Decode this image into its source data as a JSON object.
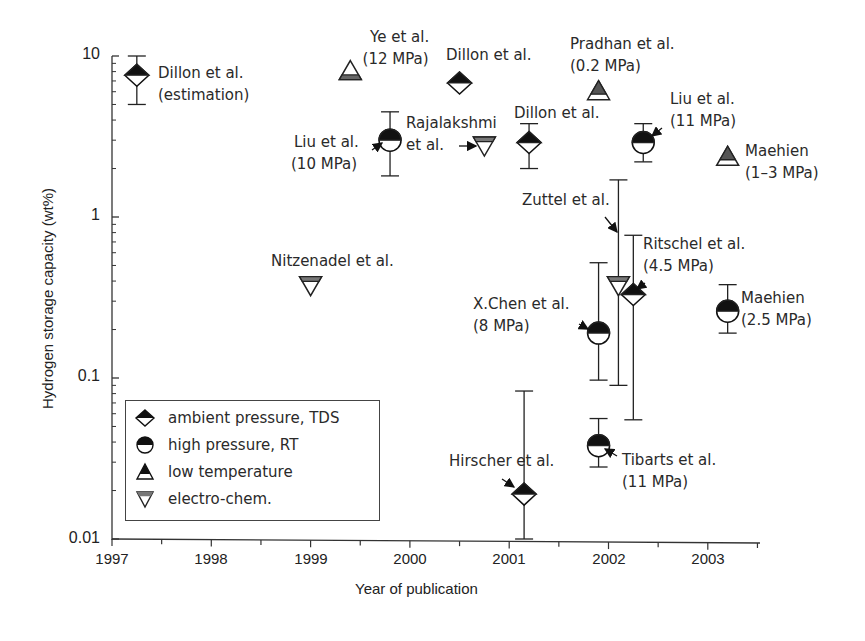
{
  "chart_data": {
    "type": "scatter",
    "title": "",
    "xlabel": "Year of publication",
    "ylabel": "Hydrogen storage capacity (wt%)",
    "yscale": "log",
    "xlim": [
      1997,
      2003.5
    ],
    "ylim": [
      0.01,
      10
    ],
    "x_ticks": [
      "1997",
      "1998",
      "1999",
      "2000",
      "2001",
      "2002",
      "2003"
    ],
    "y_ticks": [
      "0.01",
      "0.1",
      "1",
      "10"
    ],
    "grid": false,
    "legend_position": "lower-left",
    "legend": [
      {
        "key": "ambient",
        "label": "ambient pressure, TDS",
        "marker": "diamond-half-filled"
      },
      {
        "key": "high",
        "label": "high pressure, RT",
        "marker": "circle-half-filled"
      },
      {
        "key": "lowtemp",
        "label": "low temperature",
        "marker": "triangle-up-half-filled"
      },
      {
        "key": "electro",
        "label": "electro-chem.",
        "marker": "triangle-down-half-filled"
      }
    ],
    "points": [
      {
        "label": "Dillon et al. (estimation)",
        "series": "ambient",
        "x": 1997.25,
        "y": 7.6,
        "err_high": 10,
        "err_low": 5
      },
      {
        "label": "Ye et al. (12 MPa)",
        "series": "lowtemp",
        "x": 1999.4,
        "y": 8.0
      },
      {
        "label": "Liu et al. (10 MPa)",
        "series": "high",
        "x": 1999.8,
        "y": 3.0,
        "err_high": 4.5,
        "err_low": 1.8
      },
      {
        "label": "Dillon et al.",
        "series": "ambient",
        "x": 2000.5,
        "y": 6.8
      },
      {
        "label": "Rajalakshmi et al.",
        "series": "electro",
        "x": 2000.75,
        "y": 2.8
      },
      {
        "label": "Dillon et al.",
        "series": "ambient",
        "x": 2001.2,
        "y": 2.9,
        "err_high": 3.8,
        "err_low": 2.0
      },
      {
        "label": "Pradhan et al. (0.2 MPa)",
        "series": "lowtemp",
        "x": 2001.9,
        "y": 6.0
      },
      {
        "label": "Liu et al. (11 MPa)",
        "series": "high",
        "x": 2002.35,
        "y": 2.9,
        "err_high": 3.8,
        "err_low": 2.2
      },
      {
        "label": "Maehien (1-3 MPa)",
        "series": "lowtemp",
        "x": 2003.2,
        "y": 2.35
      },
      {
        "label": "Nitzenadel et al.",
        "series": "electro",
        "x": 1999.0,
        "y": 0.38
      },
      {
        "label": "Zuttel et al.",
        "series": "electro",
        "x": 2002.1,
        "y": 0.38,
        "err_high": 1.7,
        "err_low": 0.09
      },
      {
        "label": "Ritschel et al. (4.5 MPa)",
        "series": "ambient",
        "x": 2002.25,
        "y": 0.33,
        "err_high": 0.77,
        "err_low": 0.055
      },
      {
        "label": "X.Chen et al. (8 MPa)",
        "series": "high",
        "x": 2001.9,
        "y": 0.19,
        "err_high": 0.52,
        "err_low": 0.097
      },
      {
        "label": "Maehien (2.5 MPa)",
        "series": "high",
        "x": 2003.2,
        "y": 0.26,
        "err_high": 0.38,
        "err_low": 0.19
      },
      {
        "label": "Hirscher et al.",
        "series": "ambient",
        "x": 2001.15,
        "y": 0.019,
        "err_high": 0.083,
        "err_low": 0.01
      },
      {
        "label": "Tibarts et al. (11 MPa)",
        "series": "high",
        "x": 2001.9,
        "y": 0.038,
        "err_high": 0.056,
        "err_low": 0.028
      }
    ]
  },
  "annotations": {
    "dillon_est_1": "Dillon et al.",
    "dillon_est_2": "(estimation)",
    "ye_1": "Ye et al.",
    "ye_2": "(12 MPa)",
    "dillon2000": "Dillon et al.",
    "liu10_1": "Liu et al.",
    "liu10_2": "(10 MPa)",
    "raja_1": "Rajalakshmi",
    "raja_2": "et al.",
    "dillon2001": "Dillon et al.",
    "pradhan_1": "Pradhan et al.",
    "pradhan_2": "(0.2 MPa)",
    "liu11_1": "Liu et al.",
    "liu11_2": "(11 MPa)",
    "maehien13_1": "Maehien",
    "maehien13_2": "(1–3 MPa)",
    "nitzenadel": "Nitzenadel et al.",
    "zuttel": "Zuttel et al.",
    "ritschel_1": "Ritschel et al.",
    "ritschel_2": "(4.5 MPa)",
    "xchen_1": "X.Chen et al.",
    "xchen_2": "(8 MPa)",
    "maehien25_1": "Maehien",
    "maehien25_2": "(2.5 MPa)",
    "hirscher": "Hirscher et al.",
    "tibarts_1": "Tibarts et al.",
    "tibarts_2": "(11 MPa)"
  },
  "axes": {
    "xlabel": "Year of publication",
    "ylabel": "Hydrogen storage capacity (wt%)",
    "y_ticks": {
      "t10": "10",
      "t1": "1",
      "t01": "0.1",
      "t001": "0.01"
    },
    "x_ticks": {
      "y1997": "1997",
      "y1998": "1998",
      "y1999": "1999",
      "y2000": "2000",
      "y2001": "2001",
      "y2002": "2002",
      "y2003": "2003"
    }
  },
  "legend": {
    "ambient": "ambient pressure, TDS",
    "high": "high pressure, RT",
    "lowtemp": "low temperature",
    "electro": "electro-chem."
  },
  "colors": {
    "axis": "#333333",
    "marker_dark": "#111111",
    "marker_gray": "#666666",
    "text": "#2a2a2a"
  }
}
